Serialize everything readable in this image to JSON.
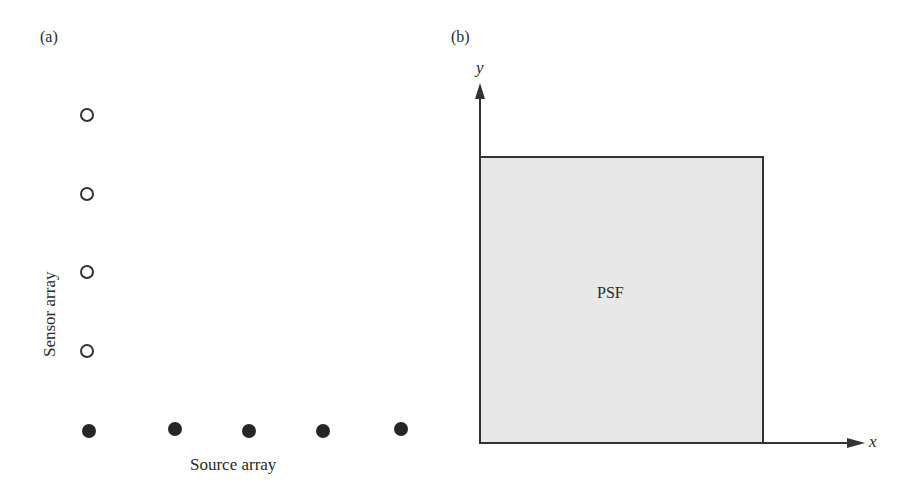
{
  "panel_a": {
    "label": "(a)",
    "sensor_axis_label": "Sensor array",
    "source_axis_label": "Source array",
    "sensors": [
      {
        "x": 87,
        "y": 115
      },
      {
        "x": 87,
        "y": 194
      },
      {
        "x": 87,
        "y": 272
      },
      {
        "x": 87,
        "y": 351
      }
    ],
    "sources": [
      {
        "x": 89,
        "y": 431
      },
      {
        "x": 175,
        "y": 429
      },
      {
        "x": 249,
        "y": 431
      },
      {
        "x": 323,
        "y": 431
      },
      {
        "x": 401,
        "y": 429
      }
    ]
  },
  "panel_b": {
    "label": "(b)",
    "x_axis_label": "x",
    "y_axis_label": "y",
    "box_label": "PSF",
    "box_fill": "#e8e8e8",
    "line_color": "#333333"
  }
}
